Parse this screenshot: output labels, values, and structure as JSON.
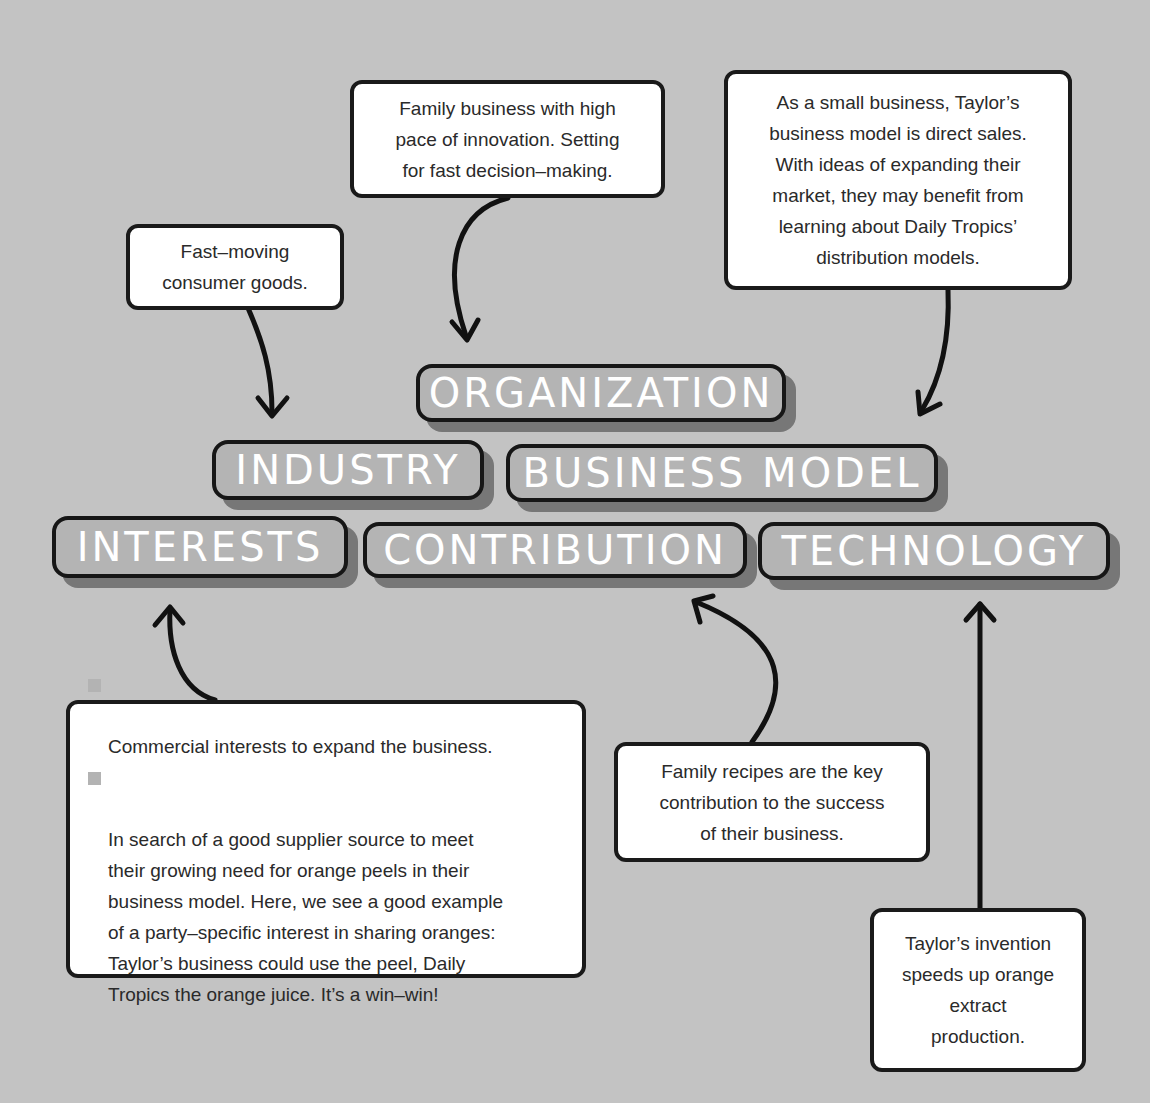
{
  "diagram": {
    "type": "concept-map",
    "background_color": "#c3c3c3",
    "tag_fill_color": "#b4b4b4",
    "tag_shadow_color": "#777777",
    "outline_color": "#161616"
  },
  "tags": {
    "organization": "ORGANIZATION",
    "industry": "INDUSTRY",
    "business_model": "BUSINESS MODEL",
    "interests": "INTERESTS",
    "contribution": "CONTRIBUTION",
    "technology": "TECHNOLOGY"
  },
  "notes": {
    "industry": "Fast–moving\nconsumer goods.",
    "organization": "Family business with high\npace of innovation. Setting\nfor fast decision–making.",
    "business_model": "As a small business, Taylor’s\nbusiness model is direct sales.\nWith ideas of expanding their\nmarket, they may benefit from\nlearning about Daily Tropics’\ndistribution models.",
    "interests": [
      "Commercial interests to expand the business.",
      "In search of a good supplier source to meet\ntheir growing need for orange peels in their\nbusiness model. Here, we see a good example\nof a party–specific interest in sharing oranges:\nTaylor’s business could use the peel, Daily\nTropics the orange juice. It’s a win–win!"
    ],
    "contribution": "Family recipes are the key\ncontribution to the success\nof their business.",
    "technology": "Taylor’s invention\nspeeds up orange\nextract\nproduction."
  }
}
